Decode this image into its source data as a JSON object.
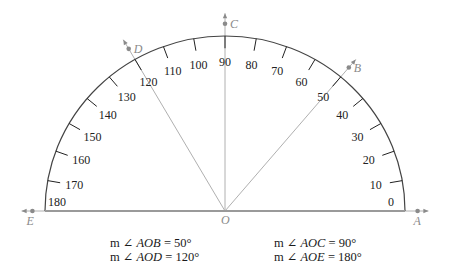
{
  "figure": {
    "center": {
      "x": 225,
      "y": 211,
      "label": "O"
    },
    "radius_x": 180,
    "radius_y": 175,
    "colors": {
      "arc": "#444444",
      "baseline": "#9a9a9a",
      "rays": "#b0b0b0",
      "points": "#8a8a8a",
      "ticks": "#222222"
    },
    "scale_labels": [
      "0",
      "10",
      "20",
      "30",
      "40",
      "50",
      "60",
      "70",
      "80",
      "90",
      "100",
      "110",
      "120",
      "130",
      "140",
      "150",
      "160",
      "170",
      "180"
    ],
    "points": [
      {
        "label": "A",
        "angle": 0
      },
      {
        "label": "B",
        "angle": 50
      },
      {
        "label": "C",
        "angle": 90
      },
      {
        "label": "D",
        "angle": 120
      },
      {
        "label": "E",
        "angle": 180
      }
    ]
  },
  "captions": [
    {
      "prefix": "m ∠ ",
      "angle": "AOB",
      "value": " = 50°"
    },
    {
      "prefix": "m ∠ ",
      "angle": "AOD",
      "value": " = 120°"
    },
    {
      "prefix": "m ∠ ",
      "angle": "AOC",
      "value": " = 90°"
    },
    {
      "prefix": "m ∠ ",
      "angle": "AOE",
      "value": " = 180°"
    }
  ]
}
